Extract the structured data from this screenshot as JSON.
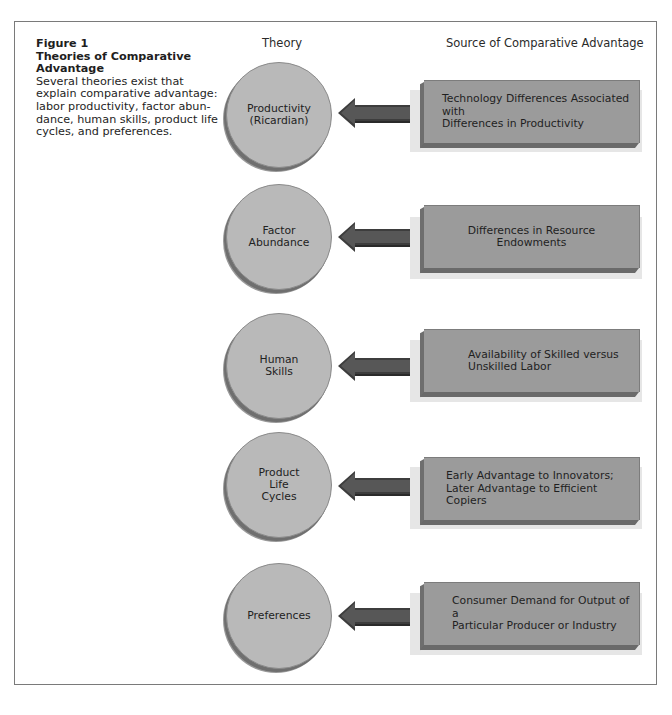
{
  "figure": {
    "number": "Figure 1",
    "title": "Theories of Comparative Advantage",
    "description": "Several theories exist that explain comparative advantage: labor productivity, factor abun-dance, human skills, product life cycles, and preferences."
  },
  "columns": {
    "theory": "Theory",
    "source": "Source of Comparative Advantage"
  },
  "rows": [
    {
      "theory": "Productivity\n(Ricardian)",
      "source": "Technology Differences Associated with\nDifferences in Productivity"
    },
    {
      "theory": "Factor\nAbundance",
      "source": "Differences in Resource Endowments"
    },
    {
      "theory": "Human\nSkills",
      "source": "Availability of Skilled versus\nUnskilled Labor"
    },
    {
      "theory": "Product\nLife\nCycles",
      "source": "Early Advantage to Innovators;\nLater Advantage to Efficient Copiers"
    },
    {
      "theory": "Preferences",
      "source": "Consumer Demand for Output of a\nParticular Producer or Industry"
    }
  ],
  "colors": {
    "disc_fill": "#b9b9b9",
    "box_fill": "#9b9b9b",
    "arrow_fill": "#4a4a4a",
    "frame_border": "#7a7a7a"
  }
}
